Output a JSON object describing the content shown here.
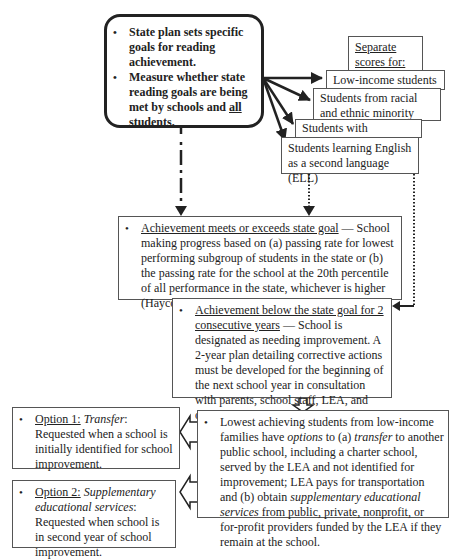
{
  "top_box": {
    "bullets": [
      "State plan sets specific goals for reading achievement.",
      "Measure whether state reading goals are being met by schools and",
      "all",
      "students."
    ]
  },
  "separate_scores": {
    "title": "Separate scores for:",
    "groups": [
      "Low-income students",
      "Students from racial and ethnic minority groups",
      "Students with disabilities",
      "Students learning English as a second language (ELL)"
    ]
  },
  "meets_box": {
    "heading": "Achievement meets or exceeds state goal",
    "body": " — School making progress based on (a) passing rate for lowest performing subgroup of students in the state or (b) the passing rate for the school at the 20th percentile of all performance in the state, whichever is higher (Haycock & Wiener, 2003)."
  },
  "below_box": {
    "heading": "Achievement below the state goal for 2 consecutive years",
    "body": " — School is designated as needing improvement. A 2-year plan detailing corrective actions must be developed for the beginning of the next school year in consultation with parents, school staff, LEA, and outside experts."
  },
  "options_box": {
    "part1": "Lowest achieving students from low-income families have ",
    "options_word": "options",
    "part2": " to (a) ",
    "transfer_word": "transfer",
    "part3": " to another public school, including a charter school, served by the LEA and not identified for improvement; LEA pays for transportation and (b) obtain ",
    "ses_word": "supplementary educational services",
    "part4": " from public, private, nonprofit, or for-profit providers funded by the LEA if they remain at the school."
  },
  "option1": {
    "label": "Option 1:",
    "name": "Transfer",
    "body": ": Requested when a school is initially identified for school improvement."
  },
  "option2": {
    "label": "Option 2:",
    "name": "Supplementary educational services",
    "body": ": Requested when school is in second year of school improvement."
  }
}
